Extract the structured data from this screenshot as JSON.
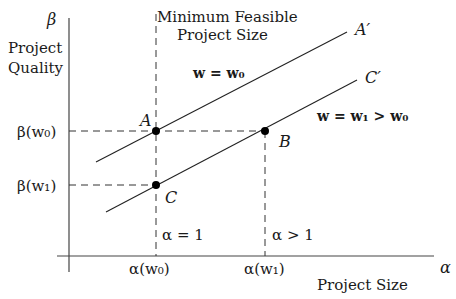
{
  "axes": {
    "y_symbol": "β",
    "y_label_line1": "Project",
    "y_label_line2": "Quality",
    "x_symbol": "α",
    "x_label": "Project Size"
  },
  "annotations": {
    "min_size_line1": "Minimum Feasible",
    "min_size_line2": "Project Size",
    "upper_curve": "w = w₀",
    "lower_curve": "w = w₁ > w₀",
    "alpha_eq_1": "α = 1",
    "alpha_gt_1": "α > 1"
  },
  "ticks": {
    "y_w0": "β(w₀)",
    "y_w1": "β(w₁)",
    "x_w0": "α(w₀)",
    "x_w1": "α(w₁)"
  },
  "points": {
    "A": "A",
    "B": "B",
    "C": "C",
    "A_prime": "A′",
    "C_prime": "C′"
  }
}
